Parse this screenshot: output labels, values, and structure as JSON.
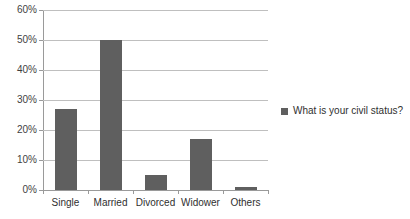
{
  "chart_data": {
    "type": "bar",
    "title": "",
    "xlabel": "",
    "ylabel": "",
    "categories": [
      "Single",
      "Married",
      "Divorced",
      "Widower",
      "Others"
    ],
    "values": [
      27,
      50,
      5,
      17,
      1
    ],
    "series": [
      {
        "name": "What is your civil status?",
        "values": [
          27,
          50,
          5,
          17,
          1
        ]
      }
    ],
    "ylim": [
      0,
      60
    ],
    "ytick_values": [
      0,
      10,
      20,
      30,
      40,
      50,
      60
    ],
    "ytick_labels": [
      "0%",
      "10%",
      "20%",
      "30%",
      "40%",
      "50%",
      "60%"
    ],
    "grid": true,
    "legend_position": "right",
    "bar_color": "#5f5f5f",
    "gridline_color": "#bfbfbf",
    "axis_color": "#9a9a9a"
  },
  "legend": {
    "entries": [
      {
        "label": "What is your civil status?",
        "color": "#5f5f5f"
      }
    ]
  },
  "title_fragment": "?"
}
